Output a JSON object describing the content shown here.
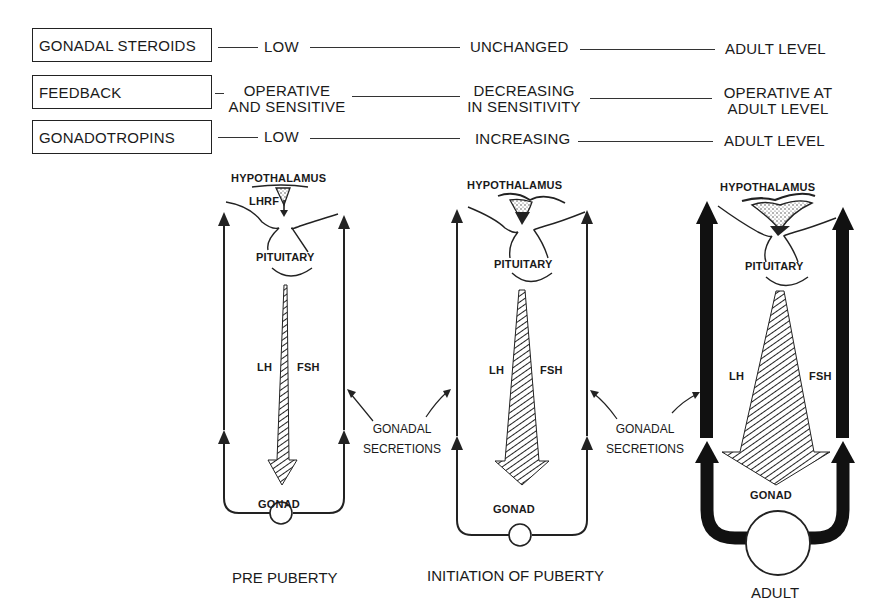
{
  "rows": [
    {
      "label": "GONADAL STEROIDS",
      "pre_puberty": "LOW",
      "initiation": "UNCHANGED",
      "adult": "ADULT LEVEL"
    },
    {
      "label": "FEEDBACK",
      "pre_puberty_line1": "OPERATIVE",
      "pre_puberty_line2": "AND SENSITIVE",
      "initiation_line1": "DECREASING",
      "initiation_line2": "IN SENSITIVITY",
      "adult_line1": "OPERATIVE AT",
      "adult_line2": "ADULT LEVEL"
    },
    {
      "label": "GONADOTROPINS",
      "pre_puberty": "LOW",
      "initiation": "INCREASING",
      "adult": "ADULT LEVEL"
    }
  ],
  "panels": [
    {
      "caption": "PRE PUBERTY",
      "hypothalamus": "HYPOTHALAMUS",
      "releasing_factor": "LHRF",
      "pituitary": "PITUITARY",
      "lh": "LH",
      "fsh": "FSH",
      "gonad": "GONAD"
    },
    {
      "caption": "INITIATION OF PUBERTY",
      "hypothalamus": "HYPOTHALAMUS",
      "pituitary": "PITUITARY",
      "lh": "LH",
      "fsh": "FSH",
      "gonad": "GONAD"
    },
    {
      "caption": "ADULT",
      "hypothalamus": "HYPOTHALAMUS",
      "pituitary": "PITUITARY",
      "lh": "LH",
      "fsh": "FSH",
      "gonad": "GONAD"
    }
  ],
  "gonadal_secretions": [
    {
      "line1": "GONADAL",
      "line2": "SECRETIONS"
    },
    {
      "line1": "GONADAL",
      "line2": "SECRETIONS"
    }
  ],
  "colors": {
    "ink": "#1a1a1a",
    "background": "#ffffff"
  }
}
